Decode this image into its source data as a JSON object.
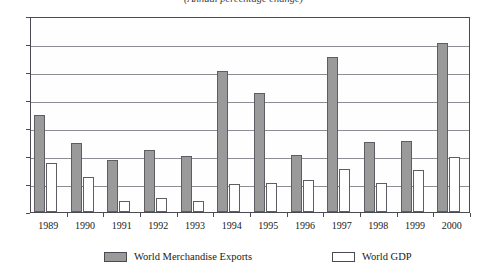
{
  "chart_data": {
    "type": "bar",
    "title": "(Annual percentage change)",
    "subtitle": "",
    "xlabel": "",
    "ylabel": "",
    "ylim": [
      0,
      14
    ],
    "ytick_step": 2,
    "yticks": [
      "0",
      "2",
      "4",
      "6",
      "8",
      "10",
      "12",
      "14"
    ],
    "grid": true,
    "legend_position": "bottom",
    "categories": [
      "1989",
      "1990",
      "1991",
      "1992",
      "1993",
      "1994",
      "1995",
      "1996",
      "1997",
      "1998",
      "1999",
      "2000"
    ],
    "series": [
      {
        "name": "World Merchandise Exports",
        "color": "#9a9a9a",
        "values": [
          6.9,
          4.9,
          3.7,
          4.4,
          4.0,
          10.1,
          8.5,
          4.1,
          11.1,
          5.0,
          5.1,
          12.1
        ]
      },
      {
        "name": "World GDP",
        "color": "#ffffff",
        "values": [
          3.5,
          2.5,
          0.8,
          1.0,
          0.8,
          2.0,
          2.1,
          2.3,
          3.1,
          2.1,
          3.0,
          3.9
        ]
      }
    ]
  },
  "legend": {
    "entries": [
      {
        "label": "World Merchandise Exports",
        "swatch": "gray-swatch"
      },
      {
        "label": "World GDP",
        "swatch": "white-swatch"
      }
    ]
  }
}
